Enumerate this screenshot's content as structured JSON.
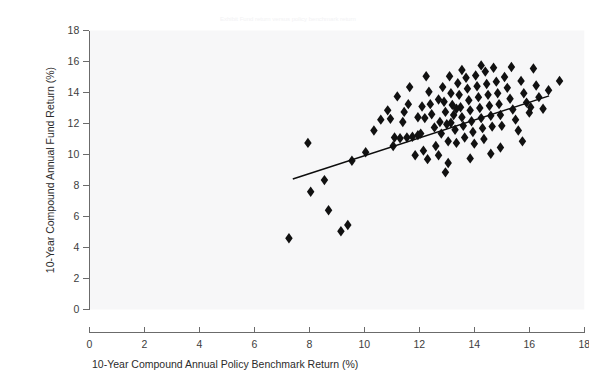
{
  "figure": {
    "top_faint_text": "Exhibit   Fund return versus policy benchmark return",
    "background_color": "#ffffff",
    "plot_background_color": "#f7f7f8",
    "marker_color": "#111111",
    "line_color": "#0d0d0d",
    "axis_color": "#6b6b6b"
  },
  "chart_data": {
    "type": "scatter",
    "title": "",
    "xlabel": "10-Year Compound Annual Policy Benchmark Return (%)",
    "ylabel": "10-Year Compound Annual Fund Return (%)",
    "xlim": [
      0,
      18
    ],
    "ylim": [
      0,
      18
    ],
    "xticks": [
      0,
      2,
      4,
      6,
      8,
      10,
      12,
      14,
      16,
      18
    ],
    "yticks": [
      0,
      2,
      4,
      6,
      8,
      10,
      12,
      14,
      16,
      18
    ],
    "xtick_labels": [
      "0",
      "2",
      "4",
      "6",
      "8",
      "10",
      "12",
      "14",
      "16",
      "18"
    ],
    "ytick_labels": [
      "0",
      "2",
      "4",
      "6",
      "8",
      "10",
      "12",
      "14",
      "16",
      "18"
    ],
    "grid": false,
    "legend": null,
    "marker_shape": "diamond",
    "marker_size": 5.2,
    "series": [
      {
        "name": "Funds",
        "points": [
          [
            7.26,
            4.6
          ],
          [
            8.7,
            6.4
          ],
          [
            9.15,
            5.05
          ],
          [
            9.4,
            5.45
          ],
          [
            8.05,
            7.6
          ],
          [
            8.55,
            8.35
          ],
          [
            7.95,
            10.75
          ],
          [
            9.55,
            9.6
          ],
          [
            10.05,
            10.15
          ],
          [
            10.35,
            11.55
          ],
          [
            10.95,
            12.3
          ],
          [
            11.1,
            11.1
          ],
          [
            11.3,
            11.05
          ],
          [
            11.55,
            11.1
          ],
          [
            11.75,
            11.15
          ],
          [
            11.95,
            11.25
          ],
          [
            12.05,
            11.35
          ],
          [
            10.6,
            12.25
          ],
          [
            11.45,
            12.75
          ],
          [
            11.6,
            13.25
          ],
          [
            11.95,
            12.4
          ],
          [
            12.1,
            13.1
          ],
          [
            12.2,
            12.35
          ],
          [
            12.35,
            14.05
          ],
          [
            12.4,
            13.25
          ],
          [
            12.45,
            12.6
          ],
          [
            12.55,
            11.75
          ],
          [
            12.6,
            10.55
          ],
          [
            12.7,
            13.55
          ],
          [
            12.75,
            12.1
          ],
          [
            12.8,
            11.35
          ],
          [
            12.85,
            14.35
          ],
          [
            12.9,
            13.4
          ],
          [
            12.95,
            12.75
          ],
          [
            13.0,
            11.95
          ],
          [
            13.05,
            10.85
          ],
          [
            13.1,
            15.05
          ],
          [
            13.15,
            13.95
          ],
          [
            13.2,
            13.2
          ],
          [
            13.25,
            12.55
          ],
          [
            13.3,
            11.6
          ],
          [
            13.35,
            10.75
          ],
          [
            13.4,
            14.6
          ],
          [
            13.45,
            13.85
          ],
          [
            13.5,
            13.05
          ],
          [
            13.55,
            12.4
          ],
          [
            13.6,
            11.85
          ],
          [
            13.65,
            11.1
          ],
          [
            13.7,
            14.95
          ],
          [
            13.75,
            14.25
          ],
          [
            13.8,
            13.5
          ],
          [
            13.85,
            12.85
          ],
          [
            13.9,
            12.15
          ],
          [
            13.95,
            11.45
          ],
          [
            14.0,
            10.7
          ],
          [
            14.05,
            15.1
          ],
          [
            14.1,
            14.4
          ],
          [
            14.15,
            13.7
          ],
          [
            14.2,
            13.0
          ],
          [
            14.25,
            12.35
          ],
          [
            14.3,
            11.7
          ],
          [
            14.35,
            11.0
          ],
          [
            14.4,
            15.35
          ],
          [
            14.45,
            14.55
          ],
          [
            14.5,
            13.85
          ],
          [
            14.55,
            13.15
          ],
          [
            14.6,
            12.5
          ],
          [
            14.65,
            11.8
          ],
          [
            14.7,
            15.6
          ],
          [
            14.8,
            14.7
          ],
          [
            14.85,
            13.95
          ],
          [
            14.9,
            13.25
          ],
          [
            14.95,
            12.55
          ],
          [
            15.0,
            11.85
          ],
          [
            15.1,
            15.0
          ],
          [
            15.2,
            14.3
          ],
          [
            15.3,
            13.6
          ],
          [
            15.4,
            12.9
          ],
          [
            15.5,
            12.25
          ],
          [
            15.6,
            11.55
          ],
          [
            15.7,
            14.75
          ],
          [
            15.8,
            13.95
          ],
          [
            15.9,
            13.35
          ],
          [
            16.0,
            12.7
          ],
          [
            16.15,
            15.55
          ],
          [
            16.25,
            14.45
          ],
          [
            16.35,
            13.7
          ],
          [
            16.5,
            12.95
          ],
          [
            16.7,
            14.15
          ],
          [
            17.1,
            14.75
          ],
          [
            12.95,
            8.85
          ],
          [
            11.85,
            9.95
          ],
          [
            12.3,
            9.7
          ],
          [
            13.05,
            9.45
          ],
          [
            13.85,
            9.75
          ],
          [
            14.6,
            10.05
          ],
          [
            12.15,
            10.25
          ],
          [
            12.7,
            9.95
          ],
          [
            14.95,
            10.45
          ],
          [
            15.75,
            10.85
          ],
          [
            11.2,
            13.75
          ],
          [
            11.65,
            14.35
          ],
          [
            12.25,
            15.05
          ],
          [
            13.55,
            15.45
          ],
          [
            14.25,
            15.75
          ],
          [
            15.35,
            15.65
          ],
          [
            16.05,
            13.05
          ],
          [
            10.85,
            12.85
          ],
          [
            11.05,
            10.55
          ],
          [
            11.4,
            12.1
          ],
          [
            13.15,
            12.05
          ],
          [
            13.35,
            12.95
          ]
        ]
      }
    ],
    "trendline": {
      "type": "linear",
      "x_start": 7.4,
      "y_start": 8.42,
      "x_end": 16.72,
      "y_end": 13.78
    }
  }
}
